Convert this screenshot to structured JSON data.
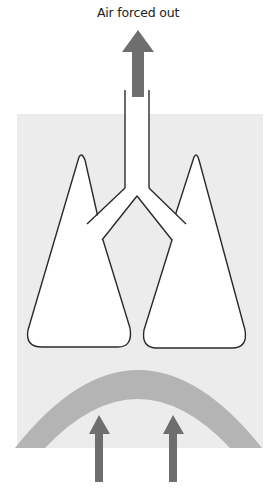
{
  "diagram": {
    "title": "Air forced out",
    "colors": {
      "background": "#ffffff",
      "chest_cavity": "#ececec",
      "lung_fill": "#ffffff",
      "outline": "#2a2a2a",
      "diaphragm": "#b4b4b4",
      "arrow": "#6e6e6e"
    },
    "elements": {
      "air_arrow": {
        "direction": "up",
        "icon": "arrow-up-icon"
      },
      "trachea": {
        "label": ""
      },
      "left_lung": {
        "label": ""
      },
      "right_lung": {
        "label": ""
      },
      "diaphragm": {
        "shape": "arc",
        "state": "raised"
      },
      "diaphragm_arrows": [
        {
          "direction": "up",
          "icon": "arrow-up-icon"
        },
        {
          "direction": "up",
          "icon": "arrow-up-icon"
        }
      ]
    }
  }
}
